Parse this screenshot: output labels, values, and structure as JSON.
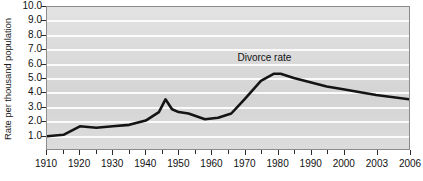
{
  "chart_data": {
    "type": "line",
    "title": "",
    "xlabel": "",
    "ylabel": "Rate per thousand population",
    "ylim": [
      0,
      10
    ],
    "xlim": [
      1910,
      2006
    ],
    "grid": true,
    "legend_position": "inline-annotation",
    "annotations": [
      {
        "text": "Divorce rate",
        "x": 1976,
        "y": 6.4
      }
    ],
    "ytick_labels": [
      "10.0",
      "9.0",
      "8.0",
      "7.0",
      "6.0",
      "5.0",
      "4.0",
      "3.0",
      "2.0",
      "1.0"
    ],
    "ytick_values": [
      10.0,
      9.0,
      8.0,
      7.0,
      6.0,
      5.0,
      4.0,
      3.0,
      2.0,
      1.0
    ],
    "xtick_labels": [
      "1910",
      "1920",
      "1930",
      "1940",
      "1950",
      "1960",
      "1970",
      "1980",
      "1990",
      "2000",
      "2003",
      "2006"
    ],
    "xtick_values": [
      1910,
      1920,
      1930,
      1940,
      1950,
      1960,
      1970,
      1980,
      1990,
      2000,
      2003,
      2006
    ],
    "xtick_minor_values": [
      1915,
      1925,
      1935,
      1945,
      1955,
      1965,
      1975,
      1985,
      1995
    ],
    "series": [
      {
        "name": "Divorce rate",
        "color": "#141414",
        "x": [
          1910,
          1915,
          1920,
          1925,
          1930,
          1935,
          1940,
          1944,
          1946,
          1948,
          1950,
          1953,
          1958,
          1962,
          1966,
          1970,
          1975,
          1979,
          1981,
          1985,
          1990,
          1995,
          2000,
          2003,
          2006
        ],
        "values": [
          0.9,
          1.0,
          1.6,
          1.5,
          1.6,
          1.7,
          2.0,
          2.6,
          3.5,
          2.8,
          2.6,
          2.5,
          2.1,
          2.2,
          2.5,
          3.5,
          4.8,
          5.3,
          5.3,
          5.0,
          4.7,
          4.4,
          4.2,
          3.8,
          3.5
        ]
      }
    ]
  }
}
